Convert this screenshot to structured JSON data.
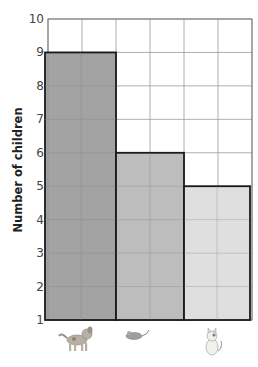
{
  "chart_data": {
    "type": "bar",
    "title": "",
    "xlabel": "",
    "ylabel": "Number of children",
    "categories": [
      "dog",
      "mouse",
      "cat"
    ],
    "category_icons": [
      "dog-icon",
      "mouse-icon",
      "cat-icon"
    ],
    "values": [
      9,
      6,
      5
    ],
    "bar_colors": [
      "#9b9b9b",
      "#b7b7b7",
      "#dcdcdc"
    ],
    "ylim": [
      1,
      10
    ],
    "yticks": [
      "1",
      "2",
      "3",
      "4",
      "5",
      "6",
      "7",
      "8",
      "9",
      "10"
    ],
    "grid": true,
    "legend": "none"
  }
}
